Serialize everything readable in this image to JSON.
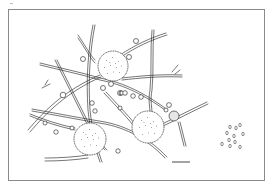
{
  "figure": {
    "colors": {
      "line": "#1a1a1a",
      "frame": "#8a8a8a",
      "background": "#ffffff",
      "swelling": "#e6e6e6"
    },
    "frame": {
      "x": 8,
      "y": 9,
      "width": 256,
      "height": 171
    },
    "spheres": [
      {
        "name": "sphere-top",
        "cx": 113,
        "cy": 66,
        "r": 15
      },
      {
        "name": "sphere-right",
        "cx": 148,
        "cy": 127,
        "r": 16
      },
      {
        "name": "sphere-left",
        "cx": 90,
        "cy": 139,
        "r": 16
      }
    ],
    "scale_bar": {
      "x1": 172,
      "x2": 190,
      "y": 162
    },
    "spore_cluster": {
      "x": 218,
      "y": 123,
      "width": 30,
      "height": 30
    }
  }
}
